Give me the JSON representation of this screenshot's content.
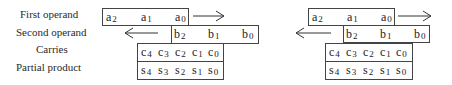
{
  "labels": {
    "first_operand": "First operand",
    "second_operand": "Second operand",
    "carries": "Carries",
    "partial_product": "Partial product"
  },
  "diagrams": [
    {
      "first_operand": [
        {
          "base": "a",
          "sub": "2"
        },
        {
          "base": "a",
          "sub": "1"
        },
        {
          "base": "a",
          "sub": "0"
        }
      ],
      "second_operand": [
        {
          "base": "b",
          "sub": "2"
        },
        {
          "base": "b",
          "sub": "1"
        },
        {
          "base": "b",
          "sub": "0"
        }
      ],
      "carries": [
        {
          "base": "c",
          "sub": "4"
        },
        {
          "base": "c",
          "sub": "3"
        },
        {
          "base": "c",
          "sub": "2"
        },
        {
          "base": "c",
          "sub": "1"
        },
        {
          "base": "c",
          "sub": "0"
        }
      ],
      "partial_product": [
        {
          "base": "s",
          "sub": "4"
        },
        {
          "base": "s",
          "sub": "3"
        },
        {
          "base": "s",
          "sub": "2"
        },
        {
          "base": "s",
          "sub": "1"
        },
        {
          "base": "s",
          "sub": "0"
        }
      ],
      "first_arrow": "right",
      "second_arrow": "left"
    },
    {
      "first_operand": [
        {
          "base": "a",
          "sub": "2"
        },
        {
          "base": "a",
          "sub": "1"
        },
        {
          "base": "a",
          "sub": "0"
        }
      ],
      "second_operand": [
        {
          "base": "b",
          "sub": "2"
        },
        {
          "base": "b",
          "sub": "1"
        },
        {
          "base": "b",
          "sub": "0"
        }
      ],
      "carries": [
        {
          "base": "c",
          "sub": "4"
        },
        {
          "base": "c",
          "sub": "3"
        },
        {
          "base": "c",
          "sub": "2"
        },
        {
          "base": "c",
          "sub": "1"
        },
        {
          "base": "c",
          "sub": "0"
        }
      ],
      "partial_product": [
        {
          "base": "s",
          "sub": "4"
        },
        {
          "base": "s",
          "sub": "3"
        },
        {
          "base": "s",
          "sub": "2"
        },
        {
          "base": "s",
          "sub": "1"
        },
        {
          "base": "s",
          "sub": "0"
        }
      ],
      "first_arrow": "right",
      "second_arrow": "left"
    }
  ]
}
